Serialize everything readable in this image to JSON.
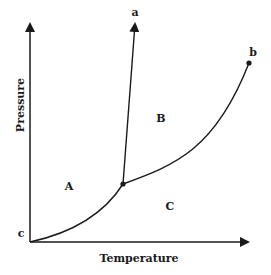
{
  "diagram": {
    "type": "phase-diagram",
    "axes": {
      "x_label": "Temperature",
      "y_label": "Pressure",
      "origin_label": "c"
    },
    "curve_labels": {
      "a": "a",
      "b": "b"
    },
    "regions": {
      "A": "A",
      "B": "B",
      "C": "C"
    },
    "colors": {
      "line": "#1a1a1a",
      "background": "#ffffff"
    }
  }
}
